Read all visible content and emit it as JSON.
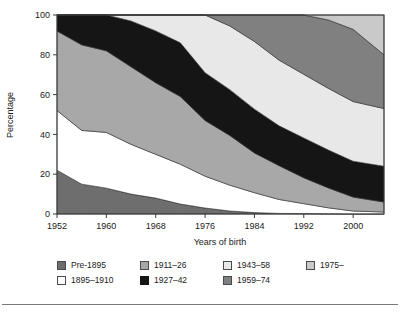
{
  "figure": {
    "background": "#ffffff",
    "rule_color": "#7a7a7a"
  },
  "axes": {
    "ylabel": "Percentage",
    "xlabel": "Years of birth",
    "yticks": [
      0,
      20,
      40,
      60,
      80,
      100
    ],
    "xticks": [
      1952,
      1960,
      1968,
      1976,
      1984,
      1992,
      2000
    ],
    "ylim": [
      0,
      100
    ],
    "xlim": [
      1952,
      2005
    ],
    "frame_color": "#3a3a3a"
  },
  "legend": {
    "items": [
      {
        "label": "Pre-1895",
        "color": "#6e6e6e",
        "border": "#4a4a4a"
      },
      {
        "label": "1911–26",
        "color": "#a8a8a8",
        "border": "#4a4a4a"
      },
      {
        "label": "1943–58",
        "color": "#e8e8e8",
        "border": "#4a4a4a"
      },
      {
        "label": "1975–",
        "color": "#c9c9c9",
        "border": "#4a4a4a"
      },
      {
        "label": "1895–1910",
        "color": "#ffffff",
        "border": "#4a4a4a"
      },
      {
        "label": "1927–42",
        "color": "#151515",
        "border": "#151515"
      },
      {
        "label": "1959–74",
        "color": "#808080",
        "border": "#4a4a4a"
      }
    ]
  },
  "chart_data": {
    "type": "area",
    "title": "",
    "xlabel": "Years of birth",
    "ylabel": "Percentage",
    "xlim": [
      1952,
      2005
    ],
    "ylim": [
      0,
      100
    ],
    "grid": false,
    "legend_position": "bottom",
    "stacked": true,
    "stack_order": "bottom-to-top",
    "x": [
      1952,
      1956,
      1960,
      1964,
      1968,
      1972,
      1976,
      1980,
      1984,
      1988,
      1992,
      1996,
      2000,
      2005
    ],
    "series": [
      {
        "name": "Pre-1895",
        "color": "#6e6e6e",
        "values": [
          22,
          15,
          13,
          10,
          8,
          5,
          3,
          1.5,
          0.7,
          0.3,
          0.2,
          0.1,
          0,
          0
        ]
      },
      {
        "name": "1895–1910",
        "color": "#ffffff",
        "values": [
          30,
          27,
          28,
          25,
          22,
          20,
          16,
          13,
          10,
          7,
          5,
          3,
          1.5,
          1
        ]
      },
      {
        "name": "1911–26",
        "color": "#a8a8a8",
        "values": [
          40,
          43,
          41,
          39,
          36,
          34,
          28,
          25,
          20,
          17,
          13,
          10,
          7,
          5
        ]
      },
      {
        "name": "1927–42",
        "color": "#151515",
        "values": [
          8,
          15,
          18,
          23,
          26,
          27,
          24,
          23,
          22,
          20,
          20,
          19,
          18,
          18
        ]
      },
      {
        "name": "1943–58",
        "color": "#e8e8e8",
        "values": [
          0,
          0,
          0,
          3,
          8,
          14,
          29,
          32,
          34,
          33,
          32,
          31,
          30,
          29
        ]
      },
      {
        "name": "1959–74",
        "color": "#808080",
        "values": [
          0,
          0,
          0,
          0,
          0,
          0,
          0,
          5.5,
          13.3,
          22.7,
          29.8,
          34.4,
          36.3,
          27
        ]
      },
      {
        "name": "1975–",
        "color": "#c9c9c9",
        "values": [
          0,
          0,
          0,
          0,
          0,
          0,
          0,
          0,
          0,
          0,
          0,
          2.5,
          7.2,
          20
        ]
      }
    ]
  }
}
